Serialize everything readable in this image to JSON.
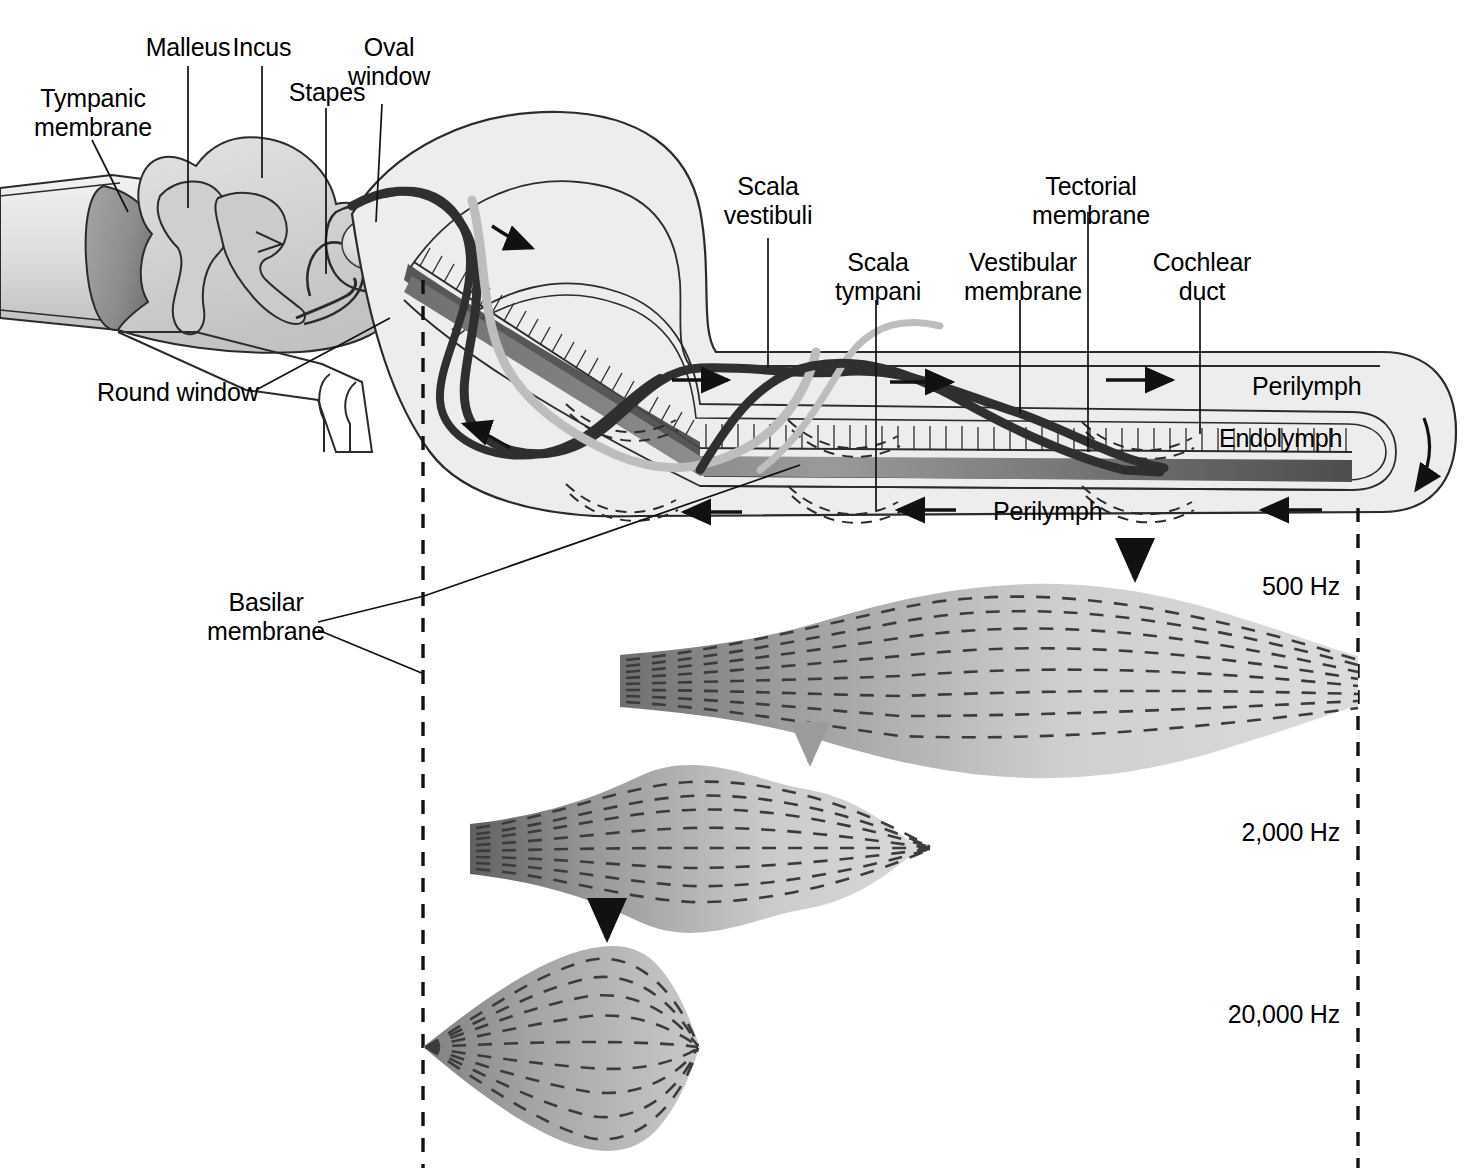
{
  "figure": {
    "type": "anatomical-diagram",
    "background_color": "#ffffff",
    "ink_color": "#000000"
  },
  "colors": {
    "outline": "#1a1a1a",
    "tissue_light": "#e9e9e9",
    "tissue_mid": "#cccccc",
    "tissue_dark": "#8f8f8f",
    "eardrum": "#8a8a8a",
    "wave_dark": "#2b2b2b",
    "wave_light": "#bdbdbd",
    "envelope_light": "#d6d6d6",
    "envelope_dark": "#8b8b8b",
    "dash_guide": "#000000"
  },
  "labels": {
    "tympanic_membrane": "Tympanic\nmembrane",
    "malleus": "Malleus",
    "incus": "Incus",
    "stapes": "Stapes",
    "oval_window": "Oval\nwindow",
    "round_window": "Round window",
    "basilar_membrane": "Basilar\nmembrane",
    "scala_vestibuli": "Scala\nvestibuli",
    "scala_tympani": "Scala\ntympani",
    "vestibular_membrane": "Vestibular\nmembrane",
    "tectorial_membrane": "Tectorial\nmembrane",
    "cochlear_duct": "Cochlear\nduct",
    "perilymph_upper": "Perilymph",
    "perilymph_lower": "Perilymph",
    "endolymph": "Endolymph"
  },
  "frequency_panels": [
    {
      "id": "panel-500",
      "label": "500 Hz",
      "peak_label_arrow_color": "#000000",
      "peak_x_fraction": 0.76,
      "envelope_max_half_height": 72,
      "baseline_y": 680,
      "onset_x": 620,
      "end_x": 1358,
      "description": "Low frequency: displacement envelope peaks near the apex (far right, helicotrema end)."
    },
    {
      "id": "panel-2000",
      "label": "2,000 Hz",
      "peak_label_arrow_color": "#9b9b9b",
      "peak_x_fraction": 0.42,
      "envelope_max_half_height": 62,
      "baseline_y": 848,
      "onset_x": 470,
      "end_x": 1358,
      "description": "Mid frequency: envelope peaks roughly mid-cochlea and dies out before the apex."
    },
    {
      "id": "panel-20000",
      "label": "20,000 Hz",
      "peak_label_arrow_color": "#000000",
      "peak_x_fraction": 0.18,
      "envelope_max_half_height": 100,
      "baseline_y": 1047,
      "onset_x": 423,
      "end_x": 1358,
      "description": "High frequency: envelope peaks close to the base (oval window end)."
    }
  ],
  "guides": {
    "left_dashed_x": 423,
    "right_dashed_x": 1358,
    "dash_pattern": "14 12"
  },
  "flow_arrows": {
    "upper_channel": [
      "right",
      "right",
      "right",
      "right"
    ],
    "lower_channel": [
      "left",
      "left",
      "left",
      "left"
    ],
    "apex_turn": "down-around",
    "note": "Perilymph flow direction arrows: scala vestibuli to the right, scala tympani back to the left."
  }
}
